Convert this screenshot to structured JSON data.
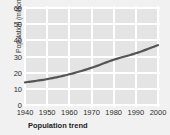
{
  "chart_data": {
    "type": "line",
    "title": "Population trend",
    "xlabel": "",
    "ylabel": "Population (millions)",
    "x": [
      1940,
      1950,
      1960,
      1970,
      1980,
      1990,
      2000
    ],
    "values": [
      14,
      16,
      19,
      23,
      28,
      32,
      37
    ],
    "series": [
      {
        "name": "Population",
        "values": [
          14,
          16,
          19,
          23,
          28,
          32,
          37
        ]
      }
    ],
    "xticks": [
      "1940",
      "1950",
      "1960",
      "1970",
      "1980",
      "1990",
      "2000"
    ],
    "yticks": [
      "0",
      "10",
      "20",
      "30",
      "40",
      "50",
      "60"
    ],
    "xlim": [
      1940,
      2000
    ],
    "ylim": [
      0,
      60
    ],
    "grid": true,
    "legend": false,
    "colors": {
      "line": "#555555",
      "plot_background": "#e4e4e4",
      "gridline": "#ffffff",
      "figure_background": "#f1f1f1",
      "text": "#2e2e2e"
    }
  }
}
